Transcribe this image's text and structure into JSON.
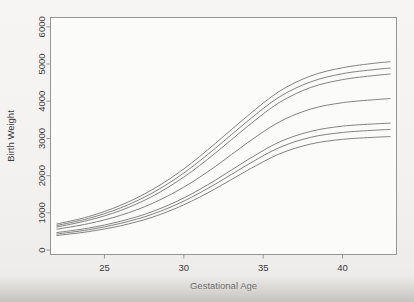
{
  "chart_data": {
    "type": "line",
    "title": "",
    "subtitle": "",
    "xlabel": "Gestational Age",
    "ylabel": "Birth Weight",
    "xlim": [
      21.6,
      43.4
    ],
    "ylim": [
      -120,
      6250
    ],
    "xticks": [
      25,
      30,
      35,
      40
    ],
    "xtick_labels": [
      "25",
      "30",
      "35",
      "40"
    ],
    "yticks": [
      0,
      1000,
      2000,
      3000,
      4000,
      5000,
      6000
    ],
    "ytick_labels": [
      "0",
      "1000",
      "2000",
      "3000",
      "4000",
      "5000",
      "6000"
    ],
    "grid": false,
    "legend": "none",
    "line_color": "#6b6b6b",
    "frame_color": "#8c8c8c",
    "background_color": "#f4f3f1",
    "x": [
      22,
      24,
      26,
      28,
      30,
      32,
      34,
      36,
      38,
      40,
      42,
      43
    ],
    "series": [
      {
        "name": "curve-1-upper",
        "values": [
          700,
          900,
          1200,
          1620,
          2180,
          2870,
          3600,
          4260,
          4680,
          4900,
          5020,
          5060
        ]
      },
      {
        "name": "curve-2-upper",
        "values": [
          660,
          850,
          1130,
          1530,
          2070,
          2740,
          3460,
          4110,
          4520,
          4740,
          4850,
          4890
        ]
      },
      {
        "name": "curve-3-upper",
        "values": [
          620,
          800,
          1060,
          1440,
          1960,
          2610,
          3320,
          3960,
          4370,
          4580,
          4690,
          4730
        ]
      },
      {
        "name": "curve-4-median",
        "values": [
          560,
          710,
          930,
          1250,
          1690,
          2250,
          2880,
          3440,
          3790,
          3960,
          4040,
          4070
        ]
      },
      {
        "name": "curve-5-lower",
        "values": [
          470,
          590,
          770,
          1030,
          1400,
          1880,
          2420,
          2900,
          3190,
          3330,
          3390,
          3410
        ]
      },
      {
        "name": "curve-6-lower",
        "values": [
          430,
          545,
          715,
          960,
          1315,
          1775,
          2290,
          2750,
          3030,
          3160,
          3220,
          3240
        ]
      },
      {
        "name": "curve-7-lower",
        "values": [
          390,
          495,
          650,
          880,
          1215,
          1650,
          2140,
          2580,
          2850,
          2975,
          3030,
          3050
        ]
      }
    ]
  },
  "figure": {
    "caption": ""
  }
}
